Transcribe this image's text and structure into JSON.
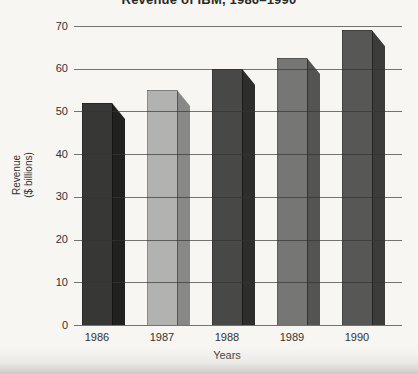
{
  "title": "Revenue of IBM, 1986–1990",
  "y_axis": {
    "title_line1": "Revenue",
    "title_line2": "($ billions)",
    "ticks": [
      70,
      60,
      50,
      40,
      30,
      20,
      10,
      0
    ]
  },
  "x_axis": {
    "title": "Years"
  },
  "chart_data": {
    "type": "bar",
    "title": "Revenue of IBM, 1986–1990",
    "xlabel": "Years",
    "ylabel": "Revenue ($ billions)",
    "categories": [
      "1986",
      "1987",
      "1988",
      "1989",
      "1990"
    ],
    "values": [
      52,
      55,
      60,
      62.5,
      69
    ],
    "ylim": [
      0,
      70
    ],
    "ytick_step": 10,
    "grid": "on",
    "gridlines_drawn_over_bars": true,
    "bar_style": "3d-chamfered-right-face",
    "bar_colors": [
      {
        "front": "#373735",
        "side": "#212120"
      },
      {
        "front": "#b2b2b0",
        "side": "#888886"
      },
      {
        "front": "#484846",
        "side": "#2d2d2b"
      },
      {
        "front": "#767674",
        "side": "#545452"
      },
      {
        "front": "#575755",
        "side": "#3c3c3a"
      }
    ]
  },
  "colors": {
    "background": "#f7f6f2",
    "gridline": "#343432",
    "text": "#33322f",
    "bottom_band": "#c6c5c2"
  }
}
